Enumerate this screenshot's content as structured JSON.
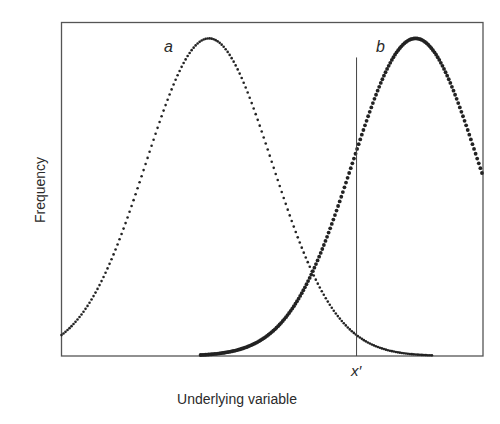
{
  "chart_data": {
    "type": "line",
    "title": "",
    "xlabel": "Underlying variable",
    "ylabel": "Frequency",
    "x_ticks": [],
    "y_ticks": [],
    "grid": false,
    "legend": "none (inline curve labels)",
    "series": [
      {
        "name": "a",
        "shape": "normal",
        "mean": 0.35,
        "sd": 0.15,
        "peak": 1.0,
        "style": "dotted (small dots)",
        "x_range": [
          0.0,
          0.88
        ]
      },
      {
        "name": "b",
        "shape": "normal",
        "mean": 0.84,
        "sd": 0.15,
        "peak": 1.0,
        "style": "dotted (heavier dots)",
        "x_range": [
          0.33,
          1.0
        ]
      }
    ],
    "annotations": [
      {
        "type": "vertical-line",
        "label": "x′",
        "x": 0.7,
        "y_top": 0.94
      },
      {
        "type": "intersection",
        "x": 0.6,
        "y": 0.24
      }
    ],
    "xlim": [
      0,
      1
    ],
    "ylim": [
      0,
      1.05
    ]
  },
  "labels": {
    "curve_a": "a",
    "curve_b": "b",
    "threshold": "x′",
    "xlabel": "Underlying variable",
    "ylabel": "Frequency"
  }
}
